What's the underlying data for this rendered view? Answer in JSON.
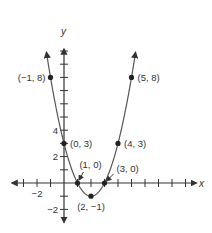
{
  "chart_data": {
    "type": "line",
    "title": "",
    "xlabel": "x",
    "ylabel": "y",
    "function": "y = (x - 2)^2 - 1",
    "xlim": [
      -3.7,
      9.8
    ],
    "ylim": [
      -2.9,
      10.3
    ],
    "x_ticks": [
      -3,
      -2,
      -1,
      1,
      2,
      3,
      4,
      5,
      6,
      7,
      8,
      9
    ],
    "y_ticks": [
      -2,
      -1,
      1,
      2,
      3,
      4,
      5,
      6,
      7,
      8,
      9,
      10
    ],
    "x_tick_labels": [
      {
        "value": -2,
        "text": "−2"
      }
    ],
    "y_tick_labels": [
      {
        "value": 4,
        "text": "4"
      },
      {
        "value": 2,
        "text": "2"
      },
      {
        "value": -2,
        "text": "−2"
      }
    ],
    "curve_x_range": [
      -1.3,
      5.3
    ],
    "grid": false,
    "color": "#555555",
    "points": [
      {
        "x": -1,
        "y": 8,
        "label": "(−1, 8)",
        "label_side": "left"
      },
      {
        "x": 5,
        "y": 8,
        "label": "(5, 8)",
        "label_side": "right"
      },
      {
        "x": 0,
        "y": 3,
        "label": "(0, 3)",
        "label_side": "right"
      },
      {
        "x": 4,
        "y": 3,
        "label": "(4, 3)",
        "label_side": "right"
      },
      {
        "x": 1,
        "y": 0,
        "label": "(1, 0)",
        "label_side": "above-arrow"
      },
      {
        "x": 3,
        "y": 0,
        "label": "(3, 0)",
        "label_side": "above-right-arrow"
      },
      {
        "x": 2,
        "y": -1,
        "label": "(2, −1)",
        "label_side": "below"
      }
    ]
  }
}
